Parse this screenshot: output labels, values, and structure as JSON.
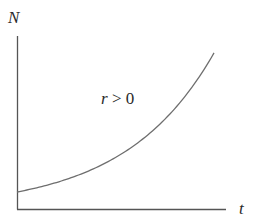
{
  "chart_data": {
    "type": "line",
    "title": "",
    "xlabel": "t",
    "ylabel": "N",
    "grid": false,
    "legend": null,
    "ticks": {
      "x": [],
      "y": []
    },
    "annotations": [
      {
        "text": "r > 0",
        "position": "center-left of curve"
      }
    ],
    "series": [
      {
        "name": "N(t) = N0 e^{rt}",
        "model": "exponential growth",
        "x": [
          0,
          0.1,
          0.2,
          0.3,
          0.4,
          0.5,
          0.6,
          0.7,
          0.8,
          0.9,
          1.0
        ],
        "values": [
          1.0,
          1.25,
          1.56,
          1.94,
          2.43,
          3.03,
          3.78,
          4.72,
          5.89,
          7.35,
          9.18
        ]
      }
    ],
    "xlim": [
      0,
      1.08
    ],
    "ylim": [
      0,
      10.2
    ],
    "colors": {
      "curve": "#6e6e6e",
      "axes": "#555555",
      "text": "#2a2a2a"
    }
  },
  "labels": {
    "y_axis": "N",
    "x_axis": "t",
    "annotation_r": "r",
    "annotation_rest": " > 0"
  }
}
